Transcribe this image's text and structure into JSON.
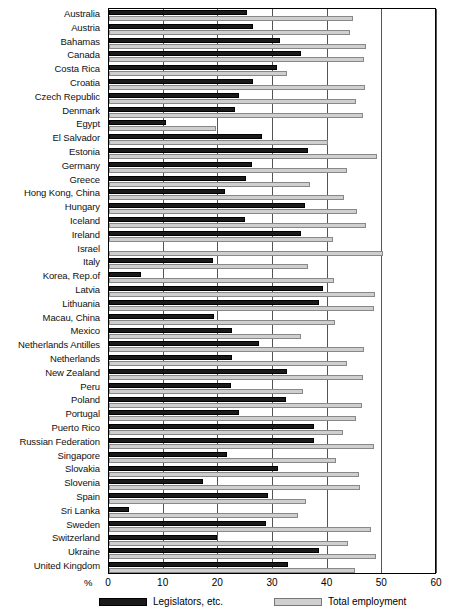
{
  "chart": {
    "type": "bar",
    "orientation": "horizontal",
    "xlabel": "%",
    "ylabel": "",
    "title": ""
  },
  "axis": {
    "unit_label": "%",
    "ticks": [
      "0",
      "10",
      "20",
      "30",
      "40",
      "50",
      "60"
    ],
    "tick_values": [
      0,
      10,
      20,
      30,
      40,
      50,
      60
    ],
    "min": 0,
    "max": 60
  },
  "legend": {
    "items": [
      {
        "label": "Legislators, etc.",
        "color": "#1a1a1a",
        "swatch": "dark"
      },
      {
        "label": "Total employment",
        "color": "#cfcfcf",
        "swatch": "light"
      }
    ]
  },
  "chart_data": {
    "type": "bar",
    "orientation": "horizontal",
    "title": "",
    "xlabel": "%",
    "ylabel": "",
    "xlim": [
      0,
      60
    ],
    "grid": true,
    "legend_position": "bottom",
    "categories": [
      "Australia",
      "Austria",
      "Bahamas",
      "Canada",
      "Costa Rica",
      "Croatia",
      "Czech Republic",
      "Denmark",
      "Egypt",
      "El Salvador",
      "Estonia",
      "Germany",
      "Greece",
      "Hong Kong, China",
      "Hungary",
      "Iceland",
      "Ireland",
      "Israel",
      "Italy",
      "Korea, Rep.of",
      "Latvia",
      "Lithuania",
      "Macau, China",
      "Mexico",
      "Netherlands Antilles",
      "Netherlands",
      "New Zealand",
      "Peru",
      "Poland",
      "Portugal",
      "Puerto Rico",
      "Russian Federation",
      "Singapore",
      "Slovakia",
      "Slovenia",
      "Spain",
      "Sri Lanka",
      "Sweden",
      "Switzerland",
      "Ukraine",
      "United Kingdom"
    ],
    "series": [
      {
        "name": "Legislators, etc.",
        "color": "#1a1a1a",
        "values": [
          25.2,
          26.3,
          31.3,
          35.2,
          30.8,
          26.3,
          23.8,
          23.0,
          10.5,
          28.0,
          36.4,
          26.2,
          25.0,
          21.3,
          35.8,
          24.8,
          35.1,
          0,
          19.0,
          5.8,
          39.1,
          38.5,
          19.2,
          22.5,
          27.5,
          22.5,
          32.5,
          22.4,
          32.3,
          23.7,
          37.5,
          37.5,
          21.5,
          31.0,
          17.2,
          29.0,
          3.7,
          28.8,
          19.8,
          38.5,
          32.8
        ]
      },
      {
        "name": "Total employment",
        "color": "#cfcfcf",
        "values": [
          44.6,
          44.0,
          47.0,
          46.6,
          32.5,
          46.8,
          45.2,
          46.5,
          19.5,
          40.0,
          49.0,
          43.6,
          36.8,
          43.0,
          45.3,
          47.0,
          41.0,
          50.2,
          36.4,
          41.2,
          48.7,
          48.5,
          41.3,
          35.2,
          46.6,
          43.6,
          46.5,
          35.5,
          46.2,
          45.2,
          42.8,
          48.4,
          41.5,
          45.8,
          46.0,
          36.0,
          34.5,
          48.0,
          43.8,
          48.8,
          45.0
        ]
      }
    ]
  }
}
